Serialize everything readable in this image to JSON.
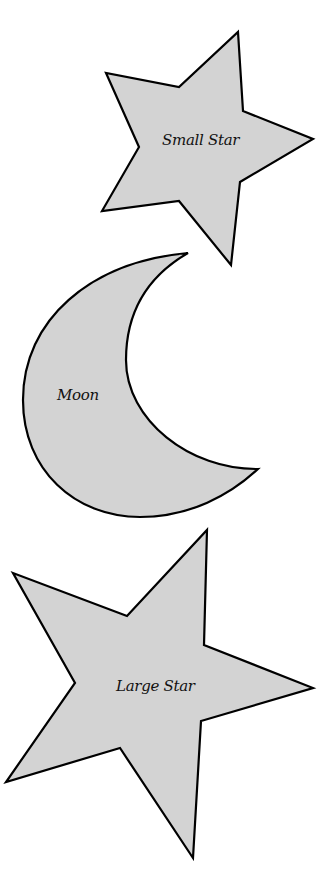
{
  "shapes": [
    {
      "id": "small-star",
      "label": "Small Star",
      "type": "star",
      "fill": "#d3d3d3",
      "stroke": "#000000"
    },
    {
      "id": "moon",
      "label": "Moon",
      "type": "crescent",
      "fill": "#d3d3d3",
      "stroke": "#000000"
    },
    {
      "id": "large-star",
      "label": "Large Star",
      "type": "star",
      "fill": "#d3d3d3",
      "stroke": "#000000"
    }
  ]
}
